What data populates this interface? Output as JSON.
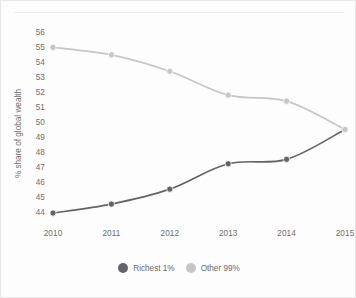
{
  "chart_data": {
    "type": "line",
    "title": "",
    "subtitle": "",
    "xlabel": "",
    "ylabel": "% share of global wealth",
    "categories": [
      "2010",
      "2011",
      "2012",
      "2013",
      "2014",
      "2015"
    ],
    "x": [
      2010,
      2011,
      2012,
      2013,
      2014,
      2015
    ],
    "xlim": [
      2010,
      2015
    ],
    "ylim": [
      43.6,
      56.2
    ],
    "yticks": [
      44,
      45,
      46,
      47,
      48,
      49,
      50,
      51,
      52,
      53,
      54,
      55,
      56
    ],
    "ytick_labels": [
      "44",
      "45",
      "46",
      "47",
      "48",
      "49",
      "50",
      "51",
      "52",
      "53",
      "54",
      "55",
      "56"
    ],
    "xtick_labels": [
      "2010",
      "2011",
      "2012",
      "2013",
      "2014",
      "2015"
    ],
    "grid": false,
    "legend_position": "bottom-center",
    "markers": "circle",
    "series": [
      {
        "name": "Richest 1%",
        "color": "#63636a",
        "values": [
          44.0,
          44.6,
          45.6,
          47.3,
          47.6,
          49.6
        ]
      },
      {
        "name": "Other 99%",
        "color": "#c6c6c6",
        "values": [
          55.1,
          54.6,
          53.5,
          51.9,
          51.5,
          49.6
        ]
      }
    ]
  },
  "legend": {
    "items": [
      {
        "label": "Richest 1%",
        "color": "#63636a"
      },
      {
        "label": "Other 99%",
        "color": "#c6c6c6"
      }
    ]
  },
  "colors": {
    "background": "#fdfdfd",
    "frame": "#e8e8e8",
    "rule": "#ebebeb",
    "text": "#6e6e6e",
    "series_dark": "#63636a",
    "series_light": "#c6c6c6"
  }
}
